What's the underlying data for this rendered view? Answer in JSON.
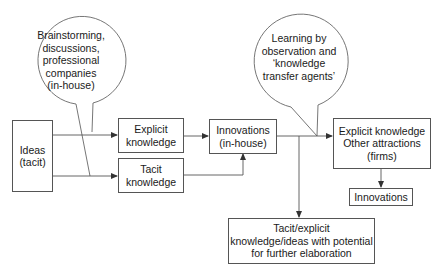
{
  "diagram": {
    "bubbles": [
      {
        "id": "brainstorming",
        "lines": [
          "Brainstorming,",
          "discussions,",
          "professional",
          "companies",
          "(in-house)"
        ]
      },
      {
        "id": "learning",
        "lines": [
          "Learning by",
          "observation and",
          "‘knowledge",
          "transfer agents’"
        ]
      }
    ],
    "boxes": {
      "ideas": {
        "lines": [
          "Ideas",
          "(tacit)"
        ]
      },
      "explicit_knowledge": {
        "lines": [
          "Explicit",
          "knowledge"
        ]
      },
      "tacit_knowledge": {
        "lines": [
          "Tacit",
          "knowledge"
        ]
      },
      "innovations_inhouse": {
        "lines": [
          "Innovations",
          "(in-house)"
        ]
      },
      "explicit_other": {
        "lines": [
          "Explicit knowledge",
          "Other attractions",
          "(firms)"
        ]
      },
      "innovations": {
        "lines": [
          "Innovations"
        ]
      },
      "tacit_explicit_potential": {
        "lines": [
          "Tacit/explicit",
          "knowledge/ideas with potential",
          "for further elaboration"
        ]
      }
    },
    "colors": {
      "line": "#555555",
      "text": "#1a1a1a",
      "background": "#ffffff"
    }
  }
}
